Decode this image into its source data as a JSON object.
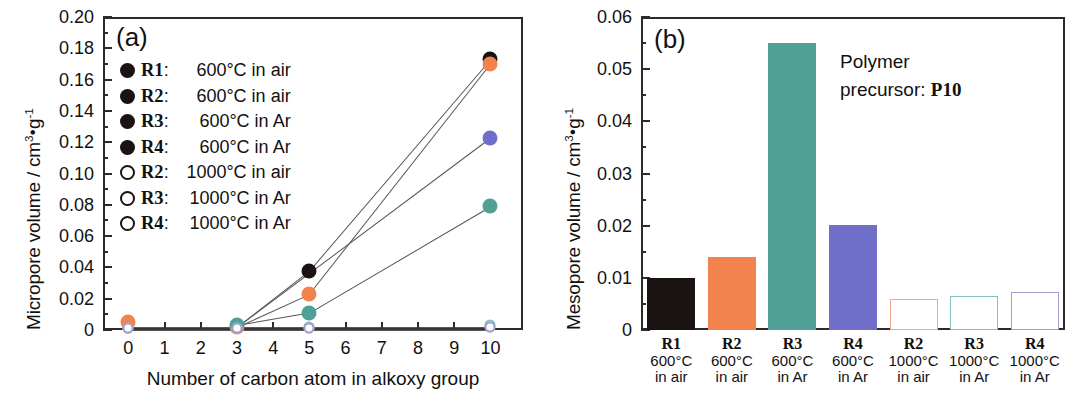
{
  "figure": {
    "panel_a_letter": "(a)",
    "panel_b_letter": "(b)"
  },
  "panel_a": {
    "ylabel_text": "Micropore volume / cm",
    "ylabel_sup1": "3",
    "ylabel_mid": "g",
    "ylabel_sup2": "-1",
    "xlabel": "Number of carbon atom in alkoxy group",
    "yticks": [
      "0",
      "0.02",
      "0.04",
      "0.06",
      "0.08",
      "0.10",
      "0.12",
      "0.14",
      "0.16",
      "0.18",
      "0.20"
    ],
    "xticks": [
      "0",
      "1",
      "2",
      "3",
      "4",
      "5",
      "6",
      "7",
      "8",
      "9",
      "10"
    ],
    "legend": [
      {
        "marker": "filled",
        "key": "R1",
        "colon": ":",
        "desc": "600°C in air"
      },
      {
        "marker": "filled",
        "key": "R2",
        "colon": ":",
        "desc": "600°C in air"
      },
      {
        "marker": "filled",
        "key": "R3",
        "colon": ":",
        "desc": "600°C in Ar"
      },
      {
        "marker": "filled",
        "key": "R4",
        "colon": ":",
        "desc": "600°C in Ar"
      },
      {
        "marker": "open",
        "key": "R2",
        "colon": ":",
        "desc": "1000°C in air"
      },
      {
        "marker": "open",
        "key": "R3",
        "colon": ":",
        "desc": "1000°C in Ar"
      },
      {
        "marker": "open",
        "key": "R4",
        "colon": ":",
        "desc": "1000°C in Ar"
      }
    ]
  },
  "panel_b": {
    "ylabel_text": "Mesopore volume / cm",
    "ylabel_sup1": "3",
    "ylabel_mid": "g",
    "ylabel_sup2": "-1",
    "yticks": [
      "0",
      "0.01",
      "0.02",
      "0.03",
      "0.04",
      "0.05",
      "0.06"
    ],
    "annotation_line1": "Polymer",
    "annotation_line2": "precursor: ",
    "annotation_bold": "P10"
  },
  "colors": {
    "black": "#1b1212",
    "orange": "#f2834f",
    "teal": "#4fa195",
    "purple": "#6f6ec8",
    "open_orange": "#f2a890",
    "open_teal": "#84c0bb",
    "open_purple": "#9f9fd8",
    "axis": "#2b2b2b"
  },
  "chart_data": [
    {
      "type": "scatter",
      "panel": "(a)",
      "title": "",
      "xlabel": "Number of carbon atom in alkoxy group",
      "ylabel": "Micropore volume / cm3·g-1",
      "xlim": [
        -0.7,
        10.9
      ],
      "ylim": [
        0,
        0.2
      ],
      "grid": false,
      "legend_position": "upper-left",
      "x": [
        0,
        3,
        5,
        10
      ],
      "series": [
        {
          "name": "R1: 600°C in air",
          "color": "#1b1212",
          "fill": "filled",
          "points": [
            {
              "x": 5,
              "y": 0.038
            },
            {
              "x": 10,
              "y": 0.173
            }
          ]
        },
        {
          "name": "R2: 600°C in air",
          "color": "#f2834f",
          "fill": "filled",
          "points": [
            {
              "x": 0,
              "y": 0.005
            },
            {
              "x": 3,
              "y": 0.002
            },
            {
              "x": 5,
              "y": 0.023
            },
            {
              "x": 10,
              "y": 0.17
            }
          ]
        },
        {
          "name": "R3: 600°C in Ar",
          "color": "#4fa195",
          "fill": "filled",
          "points": [
            {
              "x": 3,
              "y": 0.003
            },
            {
              "x": 5,
              "y": 0.011
            },
            {
              "x": 10,
              "y": 0.079
            }
          ]
        },
        {
          "name": "R4: 600°C in Ar",
          "color": "#6f6ec8",
          "fill": "filled",
          "points": [
            {
              "x": 10,
              "y": 0.123
            }
          ]
        },
        {
          "name": "R2: 1000°C in air",
          "color": "#f2a890",
          "fill": "open",
          "points": [
            {
              "x": 0,
              "y": 0.001
            },
            {
              "x": 3,
              "y": 0.001
            },
            {
              "x": 5,
              "y": 0.001
            },
            {
              "x": 10,
              "y": 0.002
            }
          ]
        },
        {
          "name": "R3: 1000°C in Ar",
          "color": "#84c0bb",
          "fill": "open",
          "points": [
            {
              "x": 0,
              "y": 0.001
            },
            {
              "x": 3,
              "y": 0.001
            },
            {
              "x": 5,
              "y": 0.002
            },
            {
              "x": 10,
              "y": 0.003
            }
          ]
        },
        {
          "name": "R4: 1000°C in Ar",
          "color": "#9f9fd8",
          "fill": "open",
          "points": [
            {
              "x": 0,
              "y": 0.001
            },
            {
              "x": 3,
              "y": 0.001
            },
            {
              "x": 5,
              "y": 0.001
            },
            {
              "x": 10,
              "y": 0.002
            }
          ]
        }
      ]
    },
    {
      "type": "bar",
      "panel": "(b)",
      "title": "Polymer precursor: P10",
      "xlabel": "",
      "ylabel": "Mesopore volume / cm3·g-1",
      "ylim": [
        0,
        0.06
      ],
      "grid": false,
      "categories": [
        {
          "key": "R1",
          "temp": "600°C",
          "atm": "in air"
        },
        {
          "key": "R2",
          "temp": "600°C",
          "atm": "in air"
        },
        {
          "key": "R3",
          "temp": "600°C",
          "atm": "in Ar"
        },
        {
          "key": "R4",
          "temp": "600°C",
          "atm": "in Ar"
        },
        {
          "key": "R2",
          "temp": "1000°C",
          "atm": "in air"
        },
        {
          "key": "R3",
          "temp": "1000°C",
          "atm": "in Ar"
        },
        {
          "key": "R4",
          "temp": "1000°C",
          "atm": "in Ar"
        }
      ],
      "values": [
        0.01,
        0.014,
        0.055,
        0.0202,
        0.006,
        0.0065,
        0.0073
      ],
      "bar_styles": [
        {
          "fill": "#1b1212",
          "style": "filled"
        },
        {
          "fill": "#f2834f",
          "style": "filled"
        },
        {
          "fill": "#4fa195",
          "style": "filled"
        },
        {
          "fill": "#6f6ec8",
          "style": "filled"
        },
        {
          "fill": "#f2a890",
          "style": "outline"
        },
        {
          "fill": "#84c0bb",
          "style": "outline"
        },
        {
          "fill": "#9f9fd8",
          "style": "outline"
        }
      ]
    }
  ]
}
